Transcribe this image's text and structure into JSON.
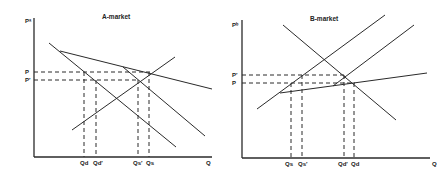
{
  "panels": [
    {
      "title": "A-market",
      "y_axis_label": "Pᵃ",
      "x_axis_label": "Q",
      "price_labels": [
        "P",
        "P′"
      ],
      "quantity_labels": [
        "Q_d",
        "Q_d′",
        "Q_s′",
        "Q_s"
      ],
      "quantity_label_display": [
        "Qd",
        "Qd′",
        "Qs′",
        "Qs"
      ]
    },
    {
      "title": "B-market",
      "y_axis_label": "Pᵇ",
      "x_axis_label": "Q",
      "price_labels": [
        "P′",
        "P"
      ],
      "quantity_labels": [
        "Q_s",
        "Q_s′",
        "Q_d′",
        "Q_d"
      ],
      "quantity_label_display": [
        "Qs",
        "Qs′",
        "Qd′",
        "Qd"
      ]
    }
  ],
  "colors": {
    "line": "#2a2a2a",
    "background": "#ffffff"
  }
}
